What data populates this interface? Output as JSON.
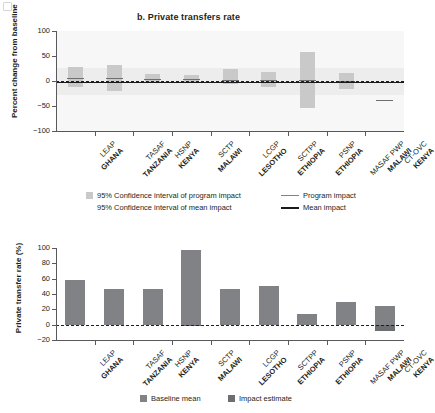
{
  "figure": {
    "corner_marker": "figure-corner-mark"
  },
  "chart_data": [
    {
      "id": "top",
      "type": "bar",
      "title": "b. Private transfers rate",
      "ylabel": "Percent change from baseline",
      "xlabel": "",
      "ylim": [
        -100,
        100
      ],
      "yticks": [
        100,
        50,
        0,
        -50,
        -100
      ],
      "ytick_labels": [
        "100",
        "50",
        "0",
        "−50",
        "−100"
      ],
      "grid": false,
      "categories": [
        {
          "program": "LEAP",
          "country": "GHANA"
        },
        {
          "program": "TASAF",
          "country": "TANZANIA"
        },
        {
          "program": "HSNP",
          "country": "KENYA"
        },
        {
          "program": "SCTP",
          "country": "MALAWI"
        },
        {
          "program": "LCGP",
          "country": "LESOTHO"
        },
        {
          "program": "SCTPP",
          "country": "ETHIOPIA"
        },
        {
          "program": "PSNP",
          "country": "ETHIOPIA"
        },
        {
          "program": "MASAF PWP",
          "country": "MALAWI"
        },
        {
          "program": "CT-OVC",
          "country": "KENYA"
        }
      ],
      "series": [
        {
          "name": "95% Confidence interval of program impact",
          "type": "interval",
          "lower": [
            -12,
            -19,
            -3,
            -3,
            -6,
            -11,
            -54,
            -16,
            null
          ],
          "upper": [
            28,
            33,
            15,
            13,
            25,
            19,
            59,
            16,
            null
          ]
        },
        {
          "name": "Program impact",
          "type": "line-marker",
          "values": [
            7,
            6,
            5,
            4,
            2,
            2,
            2,
            0,
            -37
          ]
        }
      ],
      "mean_impact": {
        "name": "Mean impact",
        "value": -1.5,
        "ci_lower": -27,
        "ci_upper": 27
      },
      "legend": {
        "position": "below-axes",
        "entries": [
          {
            "label": "95% Confidence interval of program impact",
            "marker": "box",
            "color": "#c9c9c9"
          },
          {
            "label": "Program impact",
            "marker": "line",
            "color": "#808285"
          },
          {
            "label": "95% Confidence interval of mean impact",
            "marker": "box",
            "color": "#ffffff"
          },
          {
            "label": "Mean impact",
            "marker": "line",
            "color": "#1a1a1a"
          }
        ]
      }
    },
    {
      "id": "bottom",
      "type": "bar",
      "title": "",
      "ylabel": "Private transfer rate (%)",
      "xlabel": "",
      "ylim": [
        -20,
        100
      ],
      "yticks": [
        100,
        80,
        60,
        40,
        20,
        0,
        -20
      ],
      "ytick_labels": [
        "100",
        "80",
        "60",
        "40",
        "20",
        "0",
        "−20"
      ],
      "grid": false,
      "categories": [
        {
          "program": "LEAP",
          "country": "GHANA"
        },
        {
          "program": "TASAF",
          "country": "TANZANIA"
        },
        {
          "program": "HSNP",
          "country": "KENYA"
        },
        {
          "program": "SCTP",
          "country": "MALAWI"
        },
        {
          "program": "LCGP",
          "country": "LESOTHO"
        },
        {
          "program": "SCTPP",
          "country": "ETHIOPIA"
        },
        {
          "program": "PSNP",
          "country": "ETHIOPIA"
        },
        {
          "program": "MASAF PWP",
          "country": "MALAWI"
        },
        {
          "program": "CT-OVC",
          "country": "KENYA"
        }
      ],
      "series": [
        {
          "name": "Baseline mean",
          "color": "#808285",
          "values": [
            58,
            47,
            46,
            98,
            47,
            51,
            14,
            30,
            24
          ]
        },
        {
          "name": "Impact estimate",
          "color": "#6d6e71",
          "values": [
            0,
            0,
            0,
            -2,
            0,
            0,
            0,
            0,
            -8
          ]
        }
      ],
      "legend": {
        "position": "below-axes",
        "entries": [
          {
            "label": "Baseline mean",
            "marker": "box",
            "color": "#808285"
          },
          {
            "label": "Impact estimate",
            "marker": "box",
            "color": "#6d6e71"
          }
        ]
      }
    }
  ]
}
